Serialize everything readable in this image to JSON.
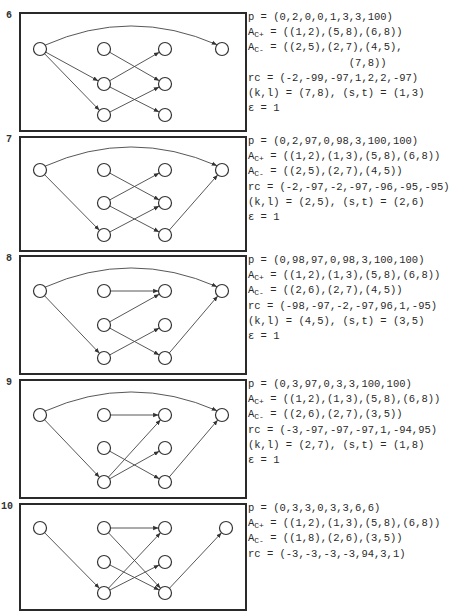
{
  "page_number": "",
  "panels": [
    {
      "number": "6",
      "box": {
        "top": 12,
        "height": 116
      },
      "nodes": [
        [
          19,
          35
        ],
        [
          83,
          35
        ],
        [
          144,
          35
        ],
        [
          83,
          70
        ],
        [
          144,
          70
        ],
        [
          83,
          101
        ],
        [
          144,
          101
        ],
        [
          201,
          35
        ]
      ],
      "edges": [
        [
          1,
          8,
          "arc"
        ],
        [
          1,
          4
        ],
        [
          1,
          6
        ],
        [
          2,
          5
        ],
        [
          4,
          3
        ],
        [
          4,
          7
        ],
        [
          6,
          5
        ]
      ],
      "info_top": 10,
      "lines": [
        {
          "pre": "p = (0,2,0,0,1,3,3,100)"
        },
        {
          "pre": "A",
          "sub": "C+",
          "post": " = ((1,2),(5,8),(6,8))"
        },
        {
          "pre": "A",
          "sub": "C-",
          "post": " = ((2,5),(2,7),(4,5),"
        },
        {
          "pre": "                (7,8))"
        },
        {
          "pre": "rc = (-2,-99,-97,1,2,2,-97)"
        },
        {
          "pre": "(k,l) = (7,8), (s,t) = (1,3)"
        },
        {
          "pre": "ε = 1"
        }
      ]
    },
    {
      "number": "7",
      "box": {
        "top": 136,
        "height": 112
      },
      "nodes": [
        [
          19,
          32
        ],
        [
          83,
          32
        ],
        [
          144,
          32
        ],
        [
          83,
          65
        ],
        [
          144,
          65
        ],
        [
          83,
          97
        ],
        [
          144,
          97
        ],
        [
          201,
          32
        ]
      ],
      "edges": [
        [
          1,
          8,
          "arc"
        ],
        [
          1,
          6
        ],
        [
          2,
          5
        ],
        [
          4,
          3
        ],
        [
          4,
          7
        ],
        [
          6,
          5
        ],
        [
          7,
          8
        ]
      ],
      "info_top": 134,
      "lines": [
        {
          "pre": "p = (0,2,97,0,98,3,100,100)"
        },
        {
          "pre": "A",
          "sub": "C+",
          "post": " = ((1,2),(1,3),(5,8),(6,8))"
        },
        {
          "pre": "A",
          "sub": "C-",
          "post": " = ((2,5),(2,7),(4,5))"
        },
        {
          "pre": "rc = (-2,-97,-2,-97,-96,-95,-95)"
        },
        {
          "pre": "(k,l) = (2,5), (s,t) = (2,6)"
        },
        {
          "pre": "ε = 1"
        }
      ]
    },
    {
      "number": "8",
      "box": {
        "top": 255,
        "height": 116
      },
      "nodes": [
        [
          19,
          34
        ],
        [
          83,
          34
        ],
        [
          144,
          34
        ],
        [
          83,
          68
        ],
        [
          144,
          68
        ],
        [
          83,
          101
        ],
        [
          144,
          101
        ],
        [
          201,
          34
        ]
      ],
      "edges": [
        [
          1,
          8,
          "arc"
        ],
        [
          1,
          6
        ],
        [
          2,
          3
        ],
        [
          4,
          3
        ],
        [
          4,
          7
        ],
        [
          6,
          5
        ],
        [
          7,
          8
        ]
      ],
      "info_top": 253,
      "lines": [
        {
          "pre": "p = (0,98,97,0,98,3,100,100)"
        },
        {
          "pre": "A",
          "sub": "C+",
          "post": " = ((1,2),(1,3),(5,8),(6,8))"
        },
        {
          "pre": "A",
          "sub": "C-",
          "post": " = ((2,6),(2,7),(4,5))"
        },
        {
          "pre": "rc = (-98,-97,-2,-97,96,1,-95)"
        },
        {
          "pre": "(k,l) = (4,5), (s,t) = (3,5)"
        },
        {
          "pre": "ε = 1"
        }
      ]
    },
    {
      "number": "9",
      "box": {
        "top": 379,
        "height": 116
      },
      "nodes": [
        [
          19,
          34
        ],
        [
          83,
          34
        ],
        [
          144,
          34
        ],
        [
          83,
          67
        ],
        [
          144,
          67
        ],
        [
          83,
          101
        ],
        [
          144,
          101
        ],
        [
          201,
          34
        ]
      ],
      "edges": [
        [
          1,
          8,
          "arc"
        ],
        [
          1,
          6
        ],
        [
          2,
          3
        ],
        [
          4,
          7
        ],
        [
          6,
          3
        ],
        [
          6,
          5
        ],
        [
          7,
          8
        ]
      ],
      "info_top": 377,
      "lines": [
        {
          "pre": "p = (0,3,97,0,3,3,100,100)"
        },
        {
          "pre": "A",
          "sub": "C+",
          "post": " = ((1,2),(1,3),(5,8),(6,8))"
        },
        {
          "pre": "A",
          "sub": "C-",
          "post": " = ((2,6),(2,7),(3,5))"
        },
        {
          "pre": "rc = (-3,-97,-97,-97,1,-94,95)"
        },
        {
          "pre": "(k,l) = (2,7), (s,t) = (1,8)"
        },
        {
          "pre": "ε = 1"
        }
      ]
    },
    {
      "number": "10",
      "box": {
        "top": 503,
        "height": 104
      },
      "nodes": [
        [
          19,
          23
        ],
        [
          83,
          23
        ],
        [
          144,
          23
        ],
        [
          83,
          57
        ],
        [
          144,
          57
        ],
        [
          83,
          88
        ],
        [
          144,
          88
        ],
        [
          205,
          23
        ]
      ],
      "edges": [
        [
          1,
          6
        ],
        [
          2,
          3
        ],
        [
          2,
          7
        ],
        [
          4,
          7
        ],
        [
          6,
          3
        ],
        [
          6,
          5
        ],
        [
          7,
          8
        ]
      ],
      "info_top": 501,
      "lines": [
        {
          "pre": "p = (0,3,3,0,3,3,6,6)"
        },
        {
          "pre": "A",
          "sub": "C+",
          "post": " = ((1,2),(1,3),(5,8),(6,8))"
        },
        {
          "pre": "A",
          "sub": "C-",
          "post": " = ((1,8),(2,6),(3,5))"
        },
        {
          "pre": "rc = (-3,-3,-3,-3,94,3,1)"
        }
      ]
    }
  ]
}
